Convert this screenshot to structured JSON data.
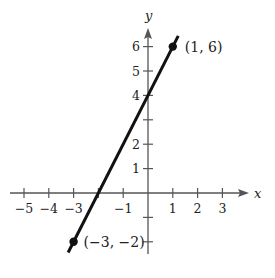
{
  "chart_data": {
    "type": "line",
    "title": "",
    "xlabel": "x",
    "ylabel": "y",
    "xlim": [
      -5.5,
      4
    ],
    "ylim": [
      -2.5,
      6.8
    ],
    "grid": false,
    "x_ticks": [
      -5,
      -4,
      -3,
      -2,
      -1,
      0,
      1,
      2,
      3
    ],
    "x_tick_labels": [
      "−5",
      "−4",
      "−3",
      "",
      "−1",
      "",
      "1",
      "2",
      "3"
    ],
    "y_ticks": [
      -2,
      -1,
      1,
      2,
      3,
      4,
      5,
      6
    ],
    "y_tick_labels": [
      "",
      "",
      "1",
      "2",
      "",
      "4",
      "5",
      "6"
    ],
    "series": [
      {
        "name": "line",
        "equation": "y = 2x + 4",
        "x": [
          -3,
          1
        ],
        "y": [
          -2,
          6
        ],
        "color": "#111111"
      }
    ],
    "points": [
      {
        "x": -3,
        "y": -2,
        "label": "(−3, −2)"
      },
      {
        "x": 1,
        "y": 6,
        "label": "(1, 6)"
      }
    ]
  },
  "axes": {
    "x_label": "x",
    "y_label": "y",
    "axis_color": "#555555",
    "line_color": "#111111"
  }
}
